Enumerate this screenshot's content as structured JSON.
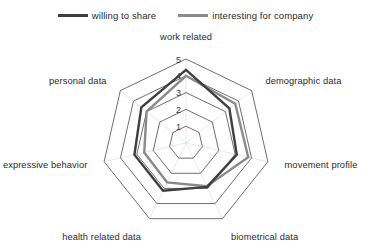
{
  "legend": {
    "entries": [
      {
        "label": "willing to share",
        "color": "#3f3f3f"
      },
      {
        "label": "interesting for company",
        "color": "#8a8a8a"
      }
    ]
  },
  "chart_data": {
    "type": "radar",
    "title": "",
    "categories": [
      "work related",
      "demographic data",
      "movement profile",
      "biometrical data",
      "health related data",
      "expressive behavior",
      "personal data"
    ],
    "tick_labels": [
      "1",
      "2",
      "3",
      "4",
      "5"
    ],
    "rlim": [
      0,
      5
    ],
    "grid": true,
    "legend_position": "top",
    "series": [
      {
        "name": "willing to share",
        "color": "#3f3f3f",
        "values": [
          4.35,
          3.3,
          3.1,
          2.9,
          3.15,
          3.15,
          3.4
        ]
      },
      {
        "name": "interesting for company",
        "color": "#8a8a8a",
        "values": [
          4.0,
          3.75,
          3.8,
          2.85,
          2.6,
          2.55,
          3.0
        ]
      }
    ]
  }
}
